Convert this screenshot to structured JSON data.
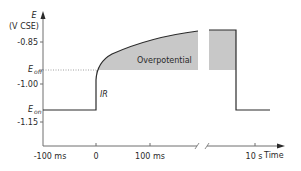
{
  "diagram": {
    "y_axis": {
      "symbol": "E",
      "unit": "(V CSE)",
      "ticks": [
        {
          "label": "-0.85",
          "y": 42
        },
        {
          "label": "-1.00",
          "y": 84
        },
        {
          "label": "-1.15",
          "y": 122
        }
      ],
      "markers": [
        {
          "symbol": "E",
          "sub": "off",
          "y": 70
        },
        {
          "symbol": "E",
          "sub": "on",
          "y": 110
        }
      ]
    },
    "x_axis": {
      "label": "Time",
      "ticks": [
        {
          "label": "-100 ms",
          "x": 45
        },
        {
          "label": "0",
          "x": 96
        },
        {
          "label": "100 ms",
          "x": 150
        },
        {
          "label": "10 s",
          "x": 255
        }
      ]
    },
    "annotations": {
      "ir_drop": "IR",
      "overpotential": "Overpotential"
    },
    "colors": {
      "line": "#2b2b2b",
      "fill": "#c8c8c8",
      "axis": "#6e6e6e",
      "dotted": "#888888"
    }
  }
}
